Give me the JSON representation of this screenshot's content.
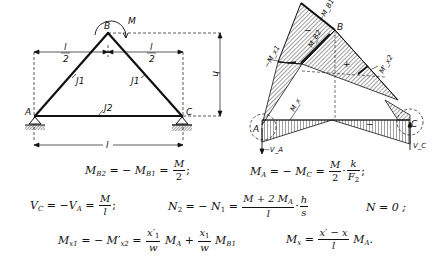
{
  "frame_diagram": {
    "nodes": {
      "A": "A",
      "B": "B",
      "C": "C"
    },
    "moment_label": "M",
    "members": {
      "left": "J1",
      "right": "J1",
      "tie": "J2"
    },
    "dimensions": {
      "half_span_num": "l",
      "half_span_den": "2",
      "height": "h",
      "span": "l"
    }
  },
  "moment_diagram": {
    "nodes": {
      "A": "A",
      "B": "B",
      "C": "C"
    },
    "labels": {
      "mb1": "−M_B1",
      "mb2": "M_B2",
      "mx1": "−M_x1",
      "mx2": "M'_x2",
      "mx": "M_x",
      "va": "−V_A",
      "vc": "V_C"
    },
    "signs": {
      "neg_top": "−",
      "pos_mid": "+",
      "neg_bottom": "−"
    }
  },
  "equations": [
    {
      "id": "eq1",
      "text": "M_B2 = − M_B1 = M/2;"
    },
    {
      "id": "eq2",
      "text": "M_A = − M_C = M/2 · k/F_2;"
    },
    {
      "id": "eq3",
      "text": "V_C = − V_A = M/l;"
    },
    {
      "id": "eq4",
      "text": "N_2 = − N_1 = (M + 2 M_A)/l · h/s"
    },
    {
      "id": "eq5",
      "text": "N = 0;"
    },
    {
      "id": "eq6",
      "text": "M_x1 = − M'_x2 = x'_1/w M_A + x_1/w M_B1"
    },
    {
      "id": "eq7",
      "text": "M_x = (x' − x)/l M_A."
    }
  ],
  "eq_parts": {
    "M": "M",
    "two": "2",
    "k": "k",
    "l": "l",
    "h": "h",
    "s": "s",
    "w": "w",
    "B2": "B2",
    "B1": "B1",
    "A": "A",
    "C": "C",
    "F": "F",
    "Vsym": "V",
    "Nsym": "N",
    "N0": "N = 0 ;",
    "M2MA": "M + 2 M",
    "x1p": "x′",
    "x1": "x",
    "sub1": "1",
    "sub2": "2",
    "xpx": "x′ − x",
    "x1sub": "x1",
    "x2sub": "x2",
    "xsub": "x"
  }
}
